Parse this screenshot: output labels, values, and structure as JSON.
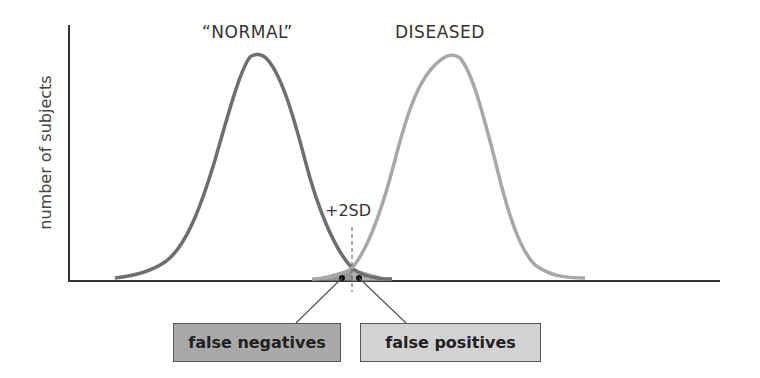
{
  "labels": {
    "normal": "“NORMAL”",
    "diseased": "DISEASED",
    "y_axis": "number of subjects",
    "threshold": "+2SD",
    "false_negatives": "false negatives",
    "false_positives": "false positives"
  },
  "colors": {
    "normal_curve": "#6e6e6e",
    "diseased_curve": "#a8a8a8",
    "false_negatives_box": "#a9a9a9",
    "false_positives_box": "#d2d2d2",
    "axis": "#333333"
  }
}
